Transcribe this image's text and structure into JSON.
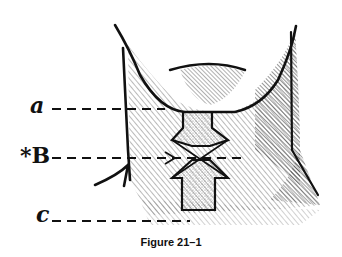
{
  "figure": {
    "caption": "Figure 21–1",
    "labels": [
      {
        "id": "a",
        "text": "a"
      },
      {
        "id": "b",
        "text": "*B"
      },
      {
        "id": "c",
        "text": "c"
      }
    ]
  }
}
